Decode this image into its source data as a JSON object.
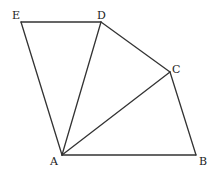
{
  "diagram": {
    "type": "geometry-figure",
    "points": {
      "A": {
        "label": "A",
        "x": 62,
        "y": 155,
        "lx": 50,
        "ly": 165
      },
      "B": {
        "label": "B",
        "x": 196,
        "y": 155,
        "lx": 199,
        "ly": 165
      },
      "C": {
        "label": "C",
        "x": 170,
        "y": 72,
        "lx": 172,
        "ly": 73
      },
      "D": {
        "label": "D",
        "x": 101,
        "y": 22,
        "lx": 97,
        "ly": 19
      },
      "E": {
        "label": "E",
        "x": 21,
        "y": 22,
        "lx": 12,
        "ly": 19
      }
    },
    "segments": [
      {
        "id": "AB",
        "from": "A",
        "to": "B"
      },
      {
        "id": "BC",
        "from": "B",
        "to": "C"
      },
      {
        "id": "CD",
        "from": "C",
        "to": "D"
      },
      {
        "id": "DE",
        "from": "D",
        "to": "E"
      },
      {
        "id": "EA",
        "from": "E",
        "to": "A"
      },
      {
        "id": "AD",
        "from": "A",
        "to": "D"
      },
      {
        "id": "AC",
        "from": "A",
        "to": "C"
      }
    ],
    "colors": {
      "stroke": "#333333",
      "label": "#222222",
      "background": "#ffffff"
    }
  }
}
